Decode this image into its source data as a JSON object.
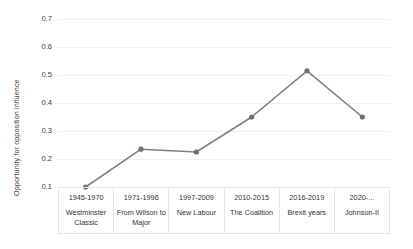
{
  "chart_data": {
    "type": "line",
    "title": "",
    "xlabel": "",
    "ylabel": "Opportunity for opposition influence",
    "ylim": [
      0.1,
      0.7
    ],
    "ytick_step": 0.1,
    "yticks": [
      "0.7",
      "0.6",
      "0.5",
      "0.4",
      "0.3",
      "0.2",
      "0.1"
    ],
    "grid": true,
    "legend": "none",
    "categories": [
      "1945-1970",
      "1971-1996",
      "1997-2009",
      "2010-2015",
      "2016-2019",
      "2020-..."
    ],
    "category_sublabels": [
      "Westminster Classic",
      "From Wilson to Major",
      "New Labour",
      "The Coalition",
      "Brexit years",
      "Johnson-II"
    ],
    "series": [
      {
        "name": "Opportunity for opposition influence",
        "values": [
          0.1,
          0.235,
          0.225,
          0.35,
          0.515,
          0.35
        ],
        "color": "#808080",
        "marker": "circle",
        "marker_color": "#707070"
      }
    ]
  },
  "axis": {
    "x_cells": [
      {
        "range": "1945-1970",
        "era": "Westminster Classic"
      },
      {
        "range": "1971-1996",
        "era": "From Wilson to Major"
      },
      {
        "range": "1997-2009",
        "era": "New Labour"
      },
      {
        "range": "2010-2015",
        "era": "The Coalition"
      },
      {
        "range": "2016-2019",
        "era": "Brexit years"
      },
      {
        "range": "2020-...",
        "era": "Johnson-II"
      }
    ]
  },
  "colors": {
    "line": "#808080",
    "marker": "#707070",
    "gridline": "#f0f0f0",
    "table_border": "#e6e6e6",
    "text": "#333333",
    "background": "#ffffff"
  }
}
